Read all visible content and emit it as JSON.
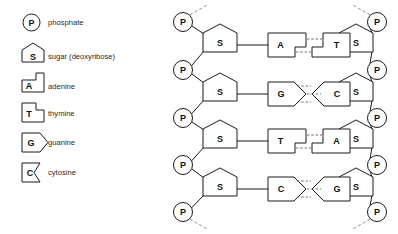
{
  "diagram": {
    "colors": {
      "stroke": "#1a1a1a",
      "hydrogen_bond": "#6e6e6e",
      "strand_tail": "#8c8c8c",
      "background": "#ffffff",
      "text": "#2a2a2a"
    }
  },
  "legend": {
    "items": [
      {
        "symbol": "P",
        "label": "phosphate",
        "shape": "circle"
      },
      {
        "symbol": "S",
        "label": "sugar (deoxyribose)",
        "shape": "pentagon"
      },
      {
        "symbol": "A",
        "label": "adenine",
        "shape": "notch-square"
      },
      {
        "symbol": "T",
        "label": "thymine",
        "shape": "tab-square"
      },
      {
        "symbol": "G",
        "label": "guanine",
        "shape": "chevron-out"
      },
      {
        "symbol": "C",
        "label": "cytosine",
        "shape": "chevron-in"
      }
    ]
  },
  "molecule": {
    "left_backbone": {
      "phosphates": [
        "P",
        "P",
        "P",
        "P",
        "P"
      ],
      "sugars": [
        "S",
        "S",
        "S",
        "S"
      ]
    },
    "right_backbone": {
      "phosphates": [
        "P",
        "P",
        "P",
        "P",
        "P"
      ],
      "sugars": [
        "S",
        "S",
        "S",
        "S"
      ]
    },
    "base_pairs": [
      {
        "left": "A",
        "right": "T",
        "hydrogen_bonds": 2
      },
      {
        "left": "G",
        "right": "C",
        "hydrogen_bonds": 3
      },
      {
        "left": "T",
        "right": "A",
        "hydrogen_bonds": 2
      },
      {
        "left": "C",
        "right": "G",
        "hydrogen_bonds": 3
      }
    ]
  }
}
